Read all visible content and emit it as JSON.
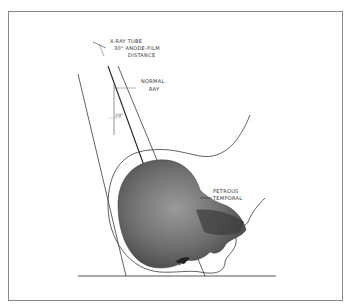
{
  "diagram": {
    "labels": {
      "tube_line1": "X-RAY TUBE",
      "tube_line2": "30\" ANODE-FILM",
      "tube_line3": "DISTANCE",
      "normal_ray_line1": "NORMAL",
      "normal_ray_line2": "RAY",
      "angle": "20°",
      "petrous_line1": "PETROUS",
      "petrous_line2": "TEMPORAL"
    },
    "colors": {
      "line": "#3a3a3a",
      "frame": "#8a8a8a",
      "skull_dark": "#4a4a4a",
      "skull_mid": "#8a8a8a",
      "skull_light": "#c8c8c8"
    }
  }
}
